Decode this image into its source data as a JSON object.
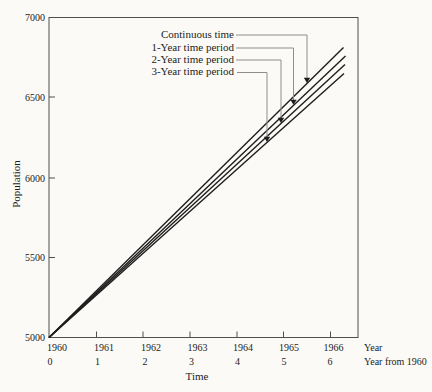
{
  "chart_data": {
    "type": "line",
    "title": "",
    "xlabel": "Time",
    "ylabel": "Population",
    "ylim": [
      5000,
      7000
    ],
    "y_ticks": [
      5000,
      5500,
      6000,
      6500,
      7000
    ],
    "x_tick_years": [
      1960,
      1961,
      1962,
      1963,
      1964,
      1965,
      1966
    ],
    "x_tick_years_from_1960": [
      0,
      1,
      2,
      3,
      4,
      5,
      6
    ],
    "grid": false,
    "legend_position": "top-center with leader-line callouts and down arrows",
    "series": [
      {
        "name": "Continuous time",
        "points": [
          {
            "year": 1960,
            "population": 5000
          },
          {
            "year": 1966.3,
            "population": 6810
          }
        ]
      },
      {
        "name": "1-Year time period",
        "points": [
          {
            "year": 1960,
            "population": 5000
          },
          {
            "year": 1966.3,
            "population": 6755
          }
        ]
      },
      {
        "name": "2-Year time period",
        "points": [
          {
            "year": 1960,
            "population": 5000
          },
          {
            "year": 1966.3,
            "population": 6700
          }
        ]
      },
      {
        "name": "3-Year time period",
        "points": [
          {
            "year": 1960,
            "population": 5000
          },
          {
            "year": 1966.3,
            "population": 6645
          }
        ]
      }
    ]
  },
  "axes": {
    "y_label": "Population",
    "x_label": "Time",
    "y_tick_labels": [
      "5000",
      "5500",
      "6000",
      "6500",
      "7000"
    ],
    "x_row1": [
      "1960",
      "1961",
      "1962",
      "1963",
      "1964",
      "1965",
      "1966"
    ],
    "x_row1_suffix": "Year",
    "x_row2": [
      "0",
      "1",
      "2",
      "3",
      "4",
      "5",
      "6"
    ],
    "x_row2_suffix": "Year from 1960"
  },
  "legend": {
    "items": [
      "Continuous time",
      "1-Year time period",
      "2-Year time period",
      "3-Year time period"
    ]
  },
  "colors": {
    "bg": "#fbfaf7",
    "axis": "#4f4f4f",
    "line": "#1d1d1d",
    "leader": "#8e8e8e",
    "arrow": "#1d1d1d",
    "text": "#1c1c1c"
  },
  "geometry": {
    "plot": {
      "left": 49,
      "top": 17.5,
      "right": 358,
      "bottom": 337.5
    },
    "tick_len": 6,
    "x_ticks_px": [
      49,
      96.5,
      143,
      190,
      237,
      283.5,
      330.5
    ],
    "y_ticks_px": [
      337.5,
      257.5,
      178,
      97,
      17.5
    ],
    "year_label_cx": [
      57,
      104,
      151,
      197.5,
      243,
      289,
      333.5
    ],
    "number_label_cx": [
      50,
      97.5,
      145,
      191.5,
      237.5,
      284,
      330
    ],
    "lines": [
      {
        "id": "continuous-time-line",
        "x1": 49,
        "y1": 337.5,
        "x2": 343.5,
        "y2": 47.5
      },
      {
        "id": "one-year-line",
        "x1": 49,
        "y1": 337.5,
        "x2": 345.5,
        "y2": 56
      },
      {
        "id": "two-year-line",
        "x1": 49,
        "y1": 337.5,
        "x2": 345,
        "y2": 64.5
      },
      {
        "id": "three-year-line",
        "x1": 49,
        "y1": 337.5,
        "x2": 344,
        "y2": 73.5
      }
    ],
    "leaders": [
      {
        "label_cy": 35,
        "start_x": 236,
        "vx": 307
      },
      {
        "label_cy": 48,
        "start_x": 236,
        "vx": 293.5
      },
      {
        "label_cy": 60,
        "start_x": 236,
        "vx": 281
      },
      {
        "label_cy": 72.5,
        "start_x": 237,
        "vx": 267
      }
    ]
  }
}
